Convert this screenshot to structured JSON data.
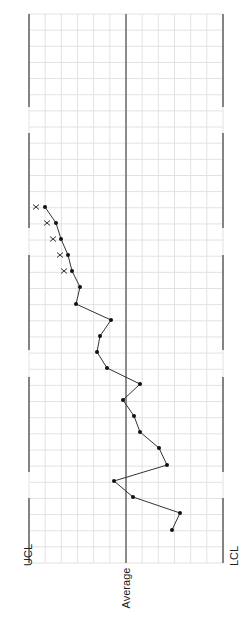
{
  "chart_data": {
    "type": "line",
    "orientation": "rotated-90 (values on horizontal axis, sequence runs bottom-to-top)",
    "title": "",
    "labels": {
      "ucl": "UCL",
      "average": "Average",
      "lcl": "LCL"
    },
    "grid": true,
    "x_columns": 12,
    "rows": 34,
    "series": [
      {
        "name": "measurements",
        "marker": "dot",
        "points_px": [
          [
            172,
            530
          ],
          [
            180,
            513
          ],
          [
            133,
            497
          ],
          [
            114,
            481
          ],
          [
            167,
            465
          ],
          [
            159,
            448
          ],
          [
            140,
            432
          ],
          [
            134,
            416
          ],
          [
            123,
            400
          ],
          [
            140,
            384
          ],
          [
            107,
            368
          ],
          [
            97,
            352
          ],
          [
            100,
            336
          ],
          [
            111,
            320
          ],
          [
            76,
            304
          ],
          [
            80,
            287
          ],
          [
            72,
            271
          ],
          [
            68,
            255
          ],
          [
            61,
            239
          ],
          [
            56,
            223
          ],
          [
            45,
            207
          ]
        ],
        "values_relative_to_average": [
          2.85,
          3.35,
          0.45,
          -0.75,
          2.55,
          2.05,
          0.85,
          0.5,
          -0.2,
          0.85,
          -1.2,
          -1.8,
          -1.6,
          -0.95,
          -3.1,
          -2.85,
          -3.35,
          -3.6,
          -4.0,
          -4.35,
          -5.0
        ]
      },
      {
        "name": "out-of-control flags",
        "marker": "x",
        "points_px": [
          [
            36,
            207
          ],
          [
            47,
            223
          ],
          [
            53,
            239
          ],
          [
            60,
            255
          ],
          [
            64,
            271
          ]
        ]
      }
    ],
    "ucl_x": 29,
    "average_x": 126,
    "lcl_x": 223,
    "ylim_units": [
      -6,
      6
    ],
    "legend": "none"
  },
  "colors": {
    "grid": "#e2e2e2",
    "axis": "#555555",
    "line": "#333333",
    "marker": "#111111"
  }
}
